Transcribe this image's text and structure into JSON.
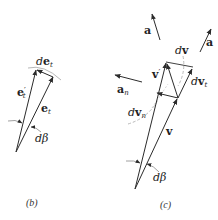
{
  "colors": {
    "line": "#2b2b2b",
    "arc": "#b8b8b8",
    "background": "#ffffff"
  },
  "figure_b": {
    "caption": "(b)",
    "vectors": {
      "e_t_prime": {
        "label_main": "e",
        "label_sub": "t",
        "label_prime": "′"
      },
      "e_t": {
        "label_main": "e",
        "label_sub": "t"
      },
      "de_t": {
        "label_d": "d",
        "label_main": "e",
        "label_sub": "t"
      }
    },
    "angle": {
      "label": "dβ"
    }
  },
  "figure_c": {
    "caption": "(c)",
    "vectors": {
      "v_prime": {
        "label_main": "v",
        "label_prime": "′"
      },
      "v": {
        "label_main": "v"
      },
      "dv": {
        "label_d": "d",
        "label_main": "v"
      },
      "dv_t": {
        "label_d": "d",
        "label_main": "v",
        "label_sub": "t"
      },
      "dv_n": {
        "label_d": "d",
        "label_main": "v",
        "label_sub": "n"
      },
      "a_left": {
        "label_main": "a"
      },
      "a_right": {
        "label_main": "a"
      },
      "a_n": {
        "label_main": "a",
        "label_sub": "n"
      }
    },
    "angle": {
      "label": "dβ"
    }
  }
}
